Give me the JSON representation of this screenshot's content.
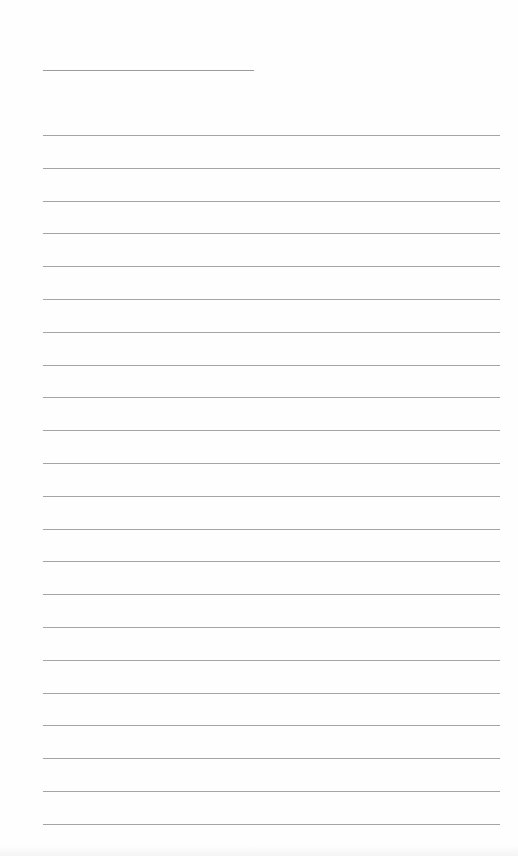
{
  "document": {
    "type": "blank lined notebook page",
    "title_line": {
      "x": 43,
      "y": 70,
      "width": 211,
      "color": "#9a9a9a"
    },
    "rules": {
      "count": 22,
      "start_y": 135,
      "spacing": 32.8,
      "x": 43,
      "width": 457,
      "color": "#a4a4a4"
    },
    "background_color": "#fefefe"
  }
}
